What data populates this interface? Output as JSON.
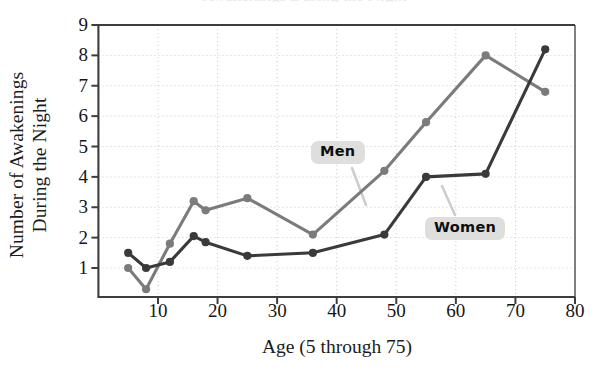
{
  "figure": {
    "title_clipped": "Awakenings During the Night",
    "x_axis_title": "Age (5 through 75)",
    "y_axis_title_line1": "Number of Awakenings",
    "y_axis_title_line2": "During the Night",
    "annotations": [
      {
        "name": "men-callout",
        "text": "Men"
      },
      {
        "name": "women-callout",
        "text": "Women"
      }
    ],
    "colors": {
      "men_line": "#7b7b7b",
      "women_line": "#3a3a3a",
      "axis": "#3d3d3d",
      "grid": "#c9c9c9",
      "callout_bg": "#dededd",
      "text": "#161616"
    }
  },
  "chart_data": {
    "type": "line",
    "title": "Awakenings During the Night",
    "xlabel": "Age (5 through 75)",
    "ylabel": "Number of Awakenings During the Night",
    "xlim": [
      0,
      80
    ],
    "ylim": [
      0,
      9
    ],
    "xticks": [
      10,
      20,
      30,
      40,
      50,
      60,
      70,
      80
    ],
    "yticks": [
      1,
      2,
      3,
      4,
      5,
      6,
      7,
      8,
      9
    ],
    "grid": true,
    "legend_position": "inline-callouts",
    "series": [
      {
        "name": "Men",
        "color": "#7b7b7b",
        "x": [
          5,
          8,
          12,
          16,
          18,
          25,
          36,
          48,
          55,
          65,
          75
        ],
        "values": [
          1.0,
          0.3,
          1.8,
          3.2,
          2.9,
          3.3,
          2.1,
          4.2,
          5.8,
          8.0,
          6.8
        ]
      },
      {
        "name": "Women",
        "color": "#3a3a3a",
        "x": [
          5,
          8,
          12,
          16,
          18,
          25,
          36,
          48,
          55,
          65,
          75
        ],
        "values": [
          1.5,
          1.0,
          1.2,
          2.05,
          1.85,
          1.4,
          1.5,
          2.1,
          4.0,
          4.1,
          8.2
        ]
      }
    ]
  }
}
